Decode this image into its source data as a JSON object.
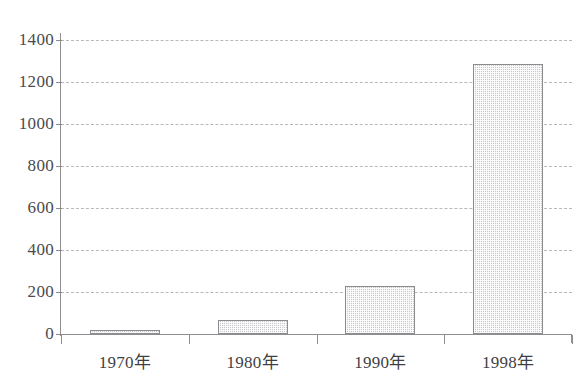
{
  "clipped_header_text": "",
  "chart_data": {
    "type": "bar",
    "title": "",
    "subtitle": "",
    "xlabel": "",
    "ylabel": "",
    "categories": [
      "1970年",
      "1980年",
      "1990年",
      "1998年"
    ],
    "values": [
      18,
      65,
      230,
      1285
    ],
    "series": [
      {
        "name": "",
        "values": [
          18,
          65,
          230,
          1285
        ]
      }
    ],
    "ylim": [
      0,
      1400
    ],
    "ytick_values": [
      0,
      200,
      400,
      600,
      800,
      1000,
      1200,
      1400
    ],
    "ytick_labels": [
      "0",
      "200",
      "400",
      "600",
      "800",
      "1000",
      "1200",
      "1400"
    ],
    "grid": true,
    "grid_style": "dashed-horizontal",
    "legend": false,
    "legend_position": "none",
    "bar_fill_color": "#c9c9cb",
    "bar_edge_color": "#8c8c90",
    "axis_color": "#8d8d92",
    "grid_color": "#b9b9bd",
    "text_color": "#3f3f44"
  }
}
